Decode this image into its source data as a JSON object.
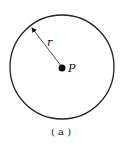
{
  "diagram": {
    "circle": {
      "cx": 62,
      "cy": 67,
      "r": 52,
      "stroke": "#222222"
    },
    "center_point": {
      "label": "P",
      "color": "#111111"
    },
    "radius_label": "r",
    "caption": "( a )"
  }
}
